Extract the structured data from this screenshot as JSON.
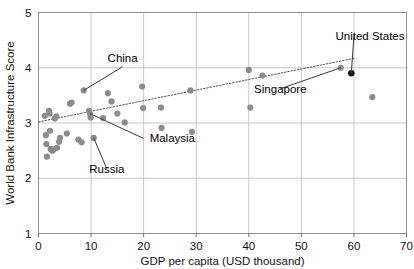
{
  "chart_data": {
    "type": "scatter",
    "title": "",
    "xlabel": "GDP per capita (USD thousand)",
    "ylabel": "World Bank Infrastructure Score",
    "xlim": [
      0,
      70
    ],
    "ylim": [
      1,
      5
    ],
    "xticks": [
      "0",
      "10",
      "20",
      "30",
      "40",
      "50",
      "60",
      "70"
    ],
    "xtick_values": [
      0,
      10,
      20,
      30,
      40,
      50,
      60,
      70
    ],
    "yticks": [
      "1",
      "2",
      "3",
      "4",
      "5"
    ],
    "ytick_values": [
      1,
      2,
      3,
      4,
      5
    ],
    "grid": "both",
    "legend": "none",
    "marker_color": "#8c8c8c",
    "highlight_color": "#1a1a1a",
    "trendline": {
      "style": "dotted",
      "color": "#555555",
      "x": [
        0,
        60
      ],
      "y": [
        3.02,
        4.17
      ]
    },
    "points": [
      {
        "x": 1.2,
        "y": 3.13
      },
      {
        "x": 1.4,
        "y": 2.78
      },
      {
        "x": 1.5,
        "y": 2.62
      },
      {
        "x": 1.6,
        "y": 2.39
      },
      {
        "x": 2.0,
        "y": 3.22
      },
      {
        "x": 2.1,
        "y": 3.17
      },
      {
        "x": 2.2,
        "y": 2.86
      },
      {
        "x": 2.3,
        "y": 2.53
      },
      {
        "x": 2.6,
        "y": 2.5
      },
      {
        "x": 2.9,
        "y": 2.52
      },
      {
        "x": 3.1,
        "y": 3.08
      },
      {
        "x": 3.4,
        "y": 3.12
      },
      {
        "x": 3.5,
        "y": 2.55
      },
      {
        "x": 3.9,
        "y": 2.66
      },
      {
        "x": 4.1,
        "y": 2.73
      },
      {
        "x": 5.4,
        "y": 2.81
      },
      {
        "x": 6.0,
        "y": 3.35
      },
      {
        "x": 6.3,
        "y": 3.37
      },
      {
        "x": 7.6,
        "y": 2.7
      },
      {
        "x": 8.2,
        "y": 2.65
      },
      {
        "x": 8.6,
        "y": 3.59
      },
      {
        "x": 9.6,
        "y": 3.22
      },
      {
        "x": 9.8,
        "y": 3.17
      },
      {
        "x": 9.9,
        "y": 3.1
      },
      {
        "x": 10.5,
        "y": 2.73
      },
      {
        "x": 12.3,
        "y": 3.09
      },
      {
        "x": 13.2,
        "y": 3.54
      },
      {
        "x": 13.9,
        "y": 3.39
      },
      {
        "x": 15.0,
        "y": 3.17
      },
      {
        "x": 16.4,
        "y": 3.01
      },
      {
        "x": 19.7,
        "y": 3.66
      },
      {
        "x": 19.9,
        "y": 3.27
      },
      {
        "x": 23.3,
        "y": 3.28
      },
      {
        "x": 23.4,
        "y": 2.91
      },
      {
        "x": 28.9,
        "y": 3.59
      },
      {
        "x": 29.2,
        "y": 2.84
      },
      {
        "x": 40.0,
        "y": 3.96
      },
      {
        "x": 40.3,
        "y": 3.28
      },
      {
        "x": 42.6,
        "y": 3.86
      },
      {
        "x": 57.5,
        "y": 4.0
      },
      {
        "x": 63.5,
        "y": 3.47
      }
    ],
    "highlight_points": [
      {
        "x": 59.5,
        "y": 3.9,
        "label": "United States"
      }
    ],
    "annotations": [
      {
        "label": "China",
        "label_x": 16.0,
        "label_y": 4.02,
        "target_x": 8.6,
        "target_y": 3.59
      },
      {
        "label": "Malaysia",
        "label_x": 20.0,
        "label_y": 2.72,
        "target_x": 9.8,
        "target_y": 3.17
      },
      {
        "label": "Russia",
        "label_x": 13.0,
        "label_y": 2.17,
        "target_x": 10.5,
        "target_y": 2.73
      },
      {
        "label": "Singapore",
        "label_x": 46.0,
        "label_y": 3.62,
        "target_x": 57.5,
        "target_y": 4.0
      },
      {
        "label": "United States",
        "label_x": 60.0,
        "label_y": 4.58,
        "target_x": 59.5,
        "target_y": 3.9
      }
    ]
  }
}
